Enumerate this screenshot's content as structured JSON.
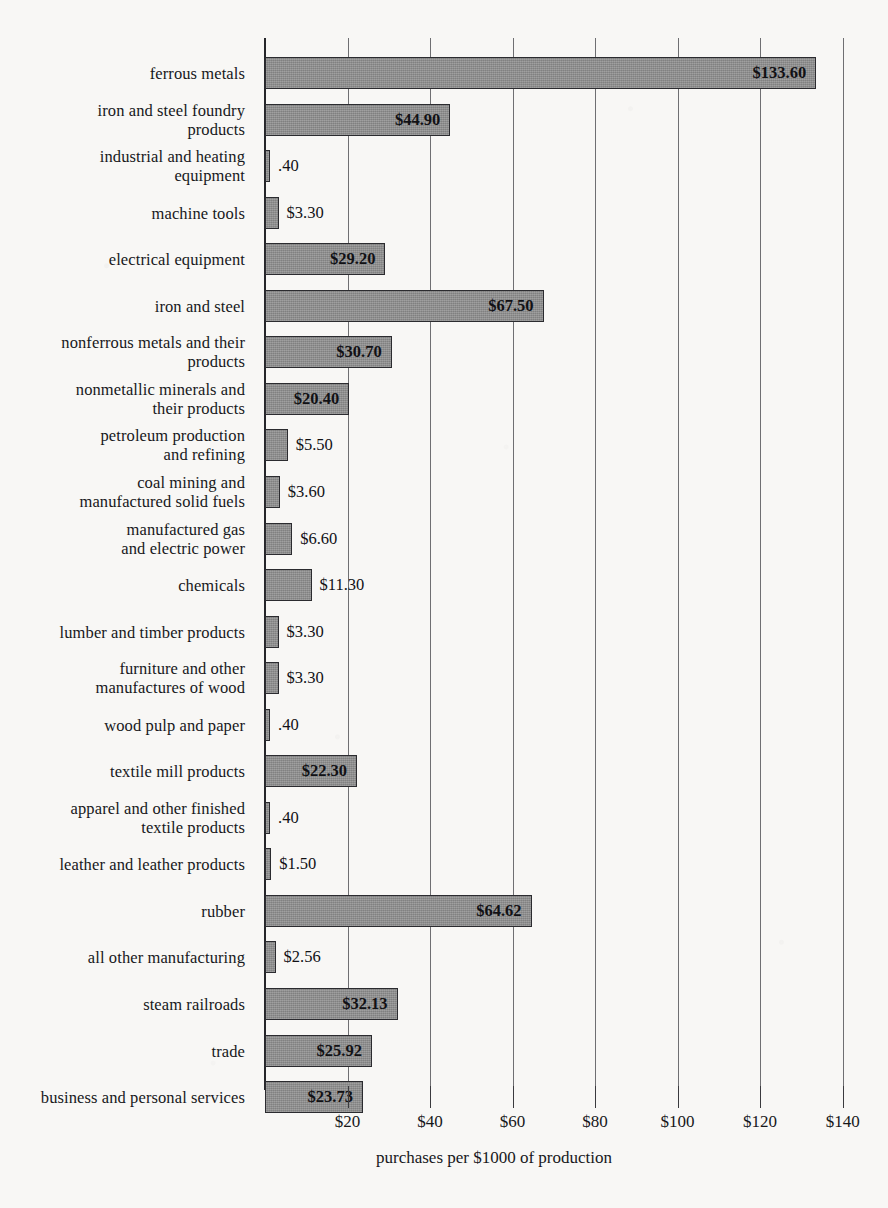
{
  "chart_data": {
    "type": "bar",
    "orientation": "horizontal",
    "title": "",
    "xlabel": "purchases per $1000 of production",
    "ylabel": "",
    "xlim": [
      0,
      145
    ],
    "grid": true,
    "legend": null,
    "xticks": [
      "$20",
      "$40",
      "$60",
      "$80",
      "$100",
      "$120",
      "$140"
    ],
    "xtick_values": [
      20,
      40,
      60,
      80,
      100,
      120,
      140
    ],
    "categories": [
      "ferrous metals",
      "iron and steel foundry\nproducts",
      "industrial and heating\nequipment",
      "machine tools",
      "electrical equipment",
      "iron and steel",
      "nonferrous metals and their\nproducts",
      "nonmetallic minerals and\ntheir products",
      "petroleum production\nand refining",
      "coal mining and\nmanufactured solid fuels",
      "manufactured gas\nand electric power",
      "chemicals",
      "lumber and timber products",
      "furniture and other\nmanufactures of wood",
      "wood pulp and paper",
      "textile mill products",
      "apparel and other finished\ntextile products",
      "leather and leather products",
      "rubber",
      "all other manufacturing",
      "steam railroads",
      "trade",
      "business and personal services"
    ],
    "values": [
      133.6,
      44.9,
      0.4,
      3.3,
      29.2,
      67.5,
      30.7,
      20.4,
      5.5,
      3.6,
      6.6,
      11.3,
      3.3,
      3.3,
      0.4,
      22.3,
      0.4,
      1.5,
      64.62,
      2.56,
      32.13,
      25.92,
      23.73
    ],
    "value_labels": [
      "$133.60",
      "$44.90",
      ".40",
      "$3.30",
      "$29.20",
      "$67.50",
      "$30.70",
      "$20.40",
      "$5.50",
      "$3.60",
      "$6.60",
      "$11.30",
      "$3.30",
      "$3.30",
      ".40",
      "$22.30",
      ".40",
      "$1.50",
      "$64.62",
      "$2.56",
      "$32.13",
      "$25.92",
      "$23.73"
    ],
    "label_placement": [
      "inside",
      "inside",
      "outside",
      "outside",
      "inside",
      "inside",
      "inside",
      "inside",
      "outside",
      "outside",
      "outside",
      "outside",
      "outside",
      "outside",
      "outside",
      "inside",
      "outside",
      "outside",
      "inside",
      "outside",
      "inside",
      "inside",
      "inside"
    ],
    "colors": {
      "bar_fill": "#8d8d8d",
      "bar_edge": "#2b2b2f",
      "axis": "#26262a",
      "gridline": "#6f6f72",
      "background": "#f8f7f5",
      "text": "#17171b"
    }
  }
}
